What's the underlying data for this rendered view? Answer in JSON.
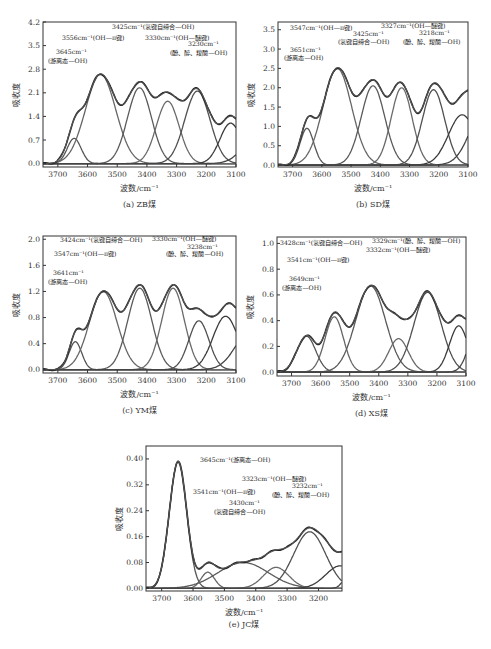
{
  "figure": {
    "panels": [
      {
        "id": "a",
        "caption": "(a) ZB煤",
        "xlabel": "波数/cm⁻¹",
        "ylabel": "吸收度",
        "box": {
          "x": 43,
          "y": 22,
          "w": 193,
          "h": 145
        },
        "xlim": [
          3750,
          3100
        ],
        "ylim": [
          -0.1,
          4.2
        ],
        "xticks": [
          3700,
          3600,
          3500,
          3400,
          3300,
          3200,
          3100
        ],
        "yticks": [
          "0.0",
          "0.7",
          "1.4",
          "2.1",
          "2.8",
          "3.5",
          "4.2"
        ],
        "yvals": [
          0,
          0.7,
          1.4,
          2.1,
          2.8,
          3.5,
          4.2
        ],
        "annotations": [
          {
            "text": "3425cm⁻¹(氢键自缔合—OH)",
            "x": 112,
            "y": 29
          },
          {
            "text": "3556cm⁻¹(OH—π键)",
            "x": 62,
            "y": 40
          },
          {
            "text": "3330cm⁻¹(OH—醚键)",
            "x": 145,
            "y": 40
          },
          {
            "text": "3230cm⁻¹",
            "x": 188,
            "y": 46
          },
          {
            "text": "3645cm⁻¹",
            "x": 56,
            "y": 54
          },
          {
            "text": "(游离态—OH)",
            "x": 48,
            "y": 63
          },
          {
            "text": "(酚、醇、羧酸—OH)",
            "x": 170,
            "y": 55
          }
        ]
      },
      {
        "id": "b",
        "caption": "(b) SD煤",
        "xlabel": "波数/cm⁻¹",
        "ylabel": "吸收度",
        "box": {
          "x": 278,
          "y": 22,
          "w": 190,
          "h": 145
        },
        "xlim": [
          3750,
          3100
        ],
        "ylim": [
          -0.05,
          3.7
        ],
        "xticks": [
          3700,
          3600,
          3500,
          3400,
          3300,
          3200,
          3100
        ],
        "yticks": [
          "0.0",
          "0.5",
          "1.0",
          "1.5",
          "2.0",
          "2.5",
          "3.0",
          "3.5"
        ],
        "yvals": [
          0,
          0.5,
          1.0,
          1.5,
          2.0,
          2.5,
          3.0,
          3.5
        ],
        "annotations": [
          {
            "text": "3547cm⁻¹(OH—π键)",
            "x": 290,
            "y": 30
          },
          {
            "text": "3327cm⁻¹(OH—醚键)",
            "x": 381,
            "y": 28
          },
          {
            "text": "3425cm⁻¹",
            "x": 353,
            "y": 36
          },
          {
            "text": "3218cm⁻¹",
            "x": 419,
            "y": 35
          },
          {
            "text": "(氢键自缔合—OH)",
            "x": 338,
            "y": 44
          },
          {
            "text": "(酚、醇、羧酸—OH)",
            "x": 403,
            "y": 44
          },
          {
            "text": "3651cm⁻¹",
            "x": 290,
            "y": 52
          },
          {
            "text": "(游离态—OH)",
            "x": 284,
            "y": 60
          }
        ]
      },
      {
        "id": "c",
        "caption": "(c) YM煤",
        "xlabel": "波数/cm⁻¹",
        "ylabel": "吸收度",
        "box": {
          "x": 43,
          "y": 236,
          "w": 193,
          "h": 137
        },
        "xlim": [
          3750,
          3100
        ],
        "ylim": [
          -0.05,
          2.05
        ],
        "xticks": [
          3700,
          3600,
          3500,
          3400,
          3300,
          3200,
          3100
        ],
        "yticks": [
          "0.0",
          "0.4",
          "0.8",
          "1.2",
          "1.6",
          "2.0"
        ],
        "yvals": [
          0,
          0.4,
          0.8,
          1.2,
          1.6,
          2.0
        ],
        "annotations": [
          {
            "text": "3424cm⁻¹(氢键自缔合—OH)",
            "x": 60,
            "y": 242
          },
          {
            "text": "3330cm⁻¹(OH—醚键)",
            "x": 152,
            "y": 241
          },
          {
            "text": "3238cm⁻¹",
            "x": 187,
            "y": 249
          },
          {
            "text": "3547cm⁻¹(OH—π键)",
            "x": 54,
            "y": 256
          },
          {
            "text": "(酚、醇、羧酸—OH)",
            "x": 166,
            "y": 256
          },
          {
            "text": "3641cm⁻¹",
            "x": 53,
            "y": 275
          },
          {
            "text": "(游离态—OH)",
            "x": 48,
            "y": 284
          }
        ]
      },
      {
        "id": "d",
        "caption": "(d) XS煤",
        "xlabel": "波数/cm⁻¹",
        "ylabel": "吸收度",
        "box": {
          "x": 277,
          "y": 237,
          "w": 189,
          "h": 139
        },
        "xlim": [
          3750,
          3100
        ],
        "ylim": [
          -0.03,
          1.05
        ],
        "xticks": [
          3700,
          3600,
          3500,
          3400,
          3300,
          3200,
          3100
        ],
        "yticks": [
          "0.0",
          "0.2",
          "0.4",
          "0.6",
          "0.8",
          "1.0"
        ],
        "yvals": [
          0,
          0.2,
          0.4,
          0.6,
          0.8,
          1.0
        ],
        "annotations": [
          {
            "text": "3428cm⁻¹(氢键自缔合—OH)",
            "x": 280,
            "y": 245
          },
          {
            "text": "3329cm⁻¹(酚、醇、羧酸—OH)",
            "x": 372,
            "y": 243
          },
          {
            "text": "3332cm⁻¹(OH—醚键)",
            "x": 366,
            "y": 252
          },
          {
            "text": "3541cm⁻¹(OH—π键)",
            "x": 287,
            "y": 262
          },
          {
            "text": "3649cm⁻¹",
            "x": 289,
            "y": 281
          },
          {
            "text": "(游离态—OH)",
            "x": 282,
            "y": 290
          }
        ]
      },
      {
        "id": "e",
        "caption": "(e) JC煤",
        "xlabel": "波数/cm⁻¹",
        "ylabel": "吸收度",
        "box": {
          "x": 146,
          "y": 446,
          "w": 196,
          "h": 145
        },
        "xlim": [
          3750,
          3125
        ],
        "ylim": [
          -0.008,
          0.44
        ],
        "xticks": [
          3700,
          3600,
          3500,
          3400,
          3300,
          3200
        ],
        "yticks": [
          "0.00",
          "0.08",
          "0.16",
          "0.24",
          "0.32",
          "0.40"
        ],
        "yvals": [
          0,
          0.08,
          0.16,
          0.24,
          0.32,
          0.4
        ],
        "annotations": [
          {
            "text": "3645cm⁻¹(游离态—OH)",
            "x": 200,
            "y": 462
          },
          {
            "text": "3323cm⁻¹(OH—醚键)",
            "x": 242,
            "y": 481
          },
          {
            "text": "3232cm⁻¹",
            "x": 292,
            "y": 488
          },
          {
            "text": "3541cm⁻¹(OH—π键)",
            "x": 193,
            "y": 494
          },
          {
            "text": "(酚、醇、羧酸—OH)",
            "x": 272,
            "y": 497
          },
          {
            "text": "3430cm⁻¹",
            "x": 229,
            "y": 505
          },
          {
            "text": "(氢键自缔合—OH)",
            "x": 214,
            "y": 514
          }
        ]
      }
    ]
  },
  "chart_data": [
    {
      "type": "line",
      "title": "(a) ZB煤",
      "xlabel": "波数/cm⁻¹",
      "ylabel": "吸收度",
      "xlim": [
        3750,
        3100
      ],
      "ylim": [
        0,
        4.2
      ],
      "xticks": [
        3700,
        3600,
        3500,
        3400,
        3300,
        3200,
        3100
      ],
      "yticks": [
        0.0,
        0.7,
        1.4,
        2.1,
        2.8,
        3.5,
        4.2
      ],
      "grid": false,
      "peaks": [
        {
          "center": 3645,
          "height": 0.75,
          "fwhm": 55,
          "label": "游离态—OH"
        },
        {
          "center": 3556,
          "height": 2.65,
          "fwhm": 120,
          "label": "OH—π键"
        },
        {
          "center": 3425,
          "height": 2.25,
          "fwhm": 95,
          "label": "氢键自缔合—OH"
        },
        {
          "center": 3330,
          "height": 1.85,
          "fwhm": 90,
          "label": "OH—醚键"
        },
        {
          "center": 3230,
          "height": 2.15,
          "fwhm": 100,
          "label": "酚、醇、羧酸—OH"
        },
        {
          "center": 3118,
          "height": 1.2,
          "fwhm": 85,
          "label": ""
        },
        {
          "center": 3020,
          "height": 0.9,
          "fwhm": 120,
          "label": ""
        }
      ],
      "annotations": [
        "3425cm⁻¹(氢键自缔合—OH)",
        "3556cm⁻¹(OH—π键)",
        "3330cm⁻¹(OH—醚键)",
        "3230cm⁻¹(酚、醇、羧酸—OH)",
        "3645cm⁻¹(游离态—OH)"
      ]
    },
    {
      "type": "line",
      "title": "(b) SD煤",
      "xlabel": "波数/cm⁻¹",
      "ylabel": "吸收度",
      "xlim": [
        3750,
        3100
      ],
      "ylim": [
        0,
        3.7
      ],
      "xticks": [
        3700,
        3600,
        3500,
        3400,
        3300,
        3200,
        3100
      ],
      "yticks": [
        0.0,
        0.5,
        1.0,
        1.5,
        2.0,
        2.5,
        3.0,
        3.5
      ],
      "grid": false,
      "peaks": [
        {
          "center": 3651,
          "height": 0.95,
          "fwhm": 55,
          "label": "游离态—OH"
        },
        {
          "center": 3547,
          "height": 2.5,
          "fwhm": 115,
          "label": "OH—π键"
        },
        {
          "center": 3425,
          "height": 2.05,
          "fwhm": 95,
          "label": "氢键自缔合—OH"
        },
        {
          "center": 3327,
          "height": 2.0,
          "fwhm": 85,
          "label": "OH—醚键"
        },
        {
          "center": 3218,
          "height": 1.95,
          "fwhm": 90,
          "label": "酚、醇、羧酸—OH"
        },
        {
          "center": 3120,
          "height": 1.3,
          "fwhm": 110,
          "label": ""
        },
        {
          "center": 3040,
          "height": 1.5,
          "fwhm": 120,
          "label": ""
        }
      ],
      "annotations": [
        "3547cm⁻¹(OH—π键)",
        "3425cm⁻¹(氢键自缔合—OH)",
        "3327cm⁻¹(OH—醚键)",
        "3218cm⁻¹(酚、醇、羧酸—OH)",
        "3651cm⁻¹(游离态—OH)"
      ]
    },
    {
      "type": "line",
      "title": "(c) YM煤",
      "xlabel": "波数/cm⁻¹",
      "ylabel": "吸收度",
      "xlim": [
        3750,
        3100
      ],
      "ylim": [
        0,
        2.0
      ],
      "xticks": [
        3700,
        3600,
        3500,
        3400,
        3300,
        3200,
        3100
      ],
      "yticks": [
        0.0,
        0.4,
        0.8,
        1.2,
        1.6,
        2.0
      ],
      "grid": false,
      "peaks": [
        {
          "center": 3641,
          "height": 0.43,
          "fwhm": 50,
          "label": "游离态—OH"
        },
        {
          "center": 3547,
          "height": 1.2,
          "fwhm": 110,
          "label": "OH—π键"
        },
        {
          "center": 3424,
          "height": 1.25,
          "fwhm": 95,
          "label": "氢键自缔合—OH"
        },
        {
          "center": 3312,
          "height": 1.25,
          "fwhm": 90,
          "label": "OH—醚键"
        },
        {
          "center": 3225,
          "height": 0.75,
          "fwhm": 80,
          "label": "酚、醇、羧酸—OH"
        },
        {
          "center": 3135,
          "height": 0.82,
          "fwhm": 100,
          "label": ""
        },
        {
          "center": 3050,
          "height": 0.6,
          "fwhm": 120,
          "label": ""
        }
      ],
      "annotations": [
        "3424cm⁻¹(氢键自缔合—OH)",
        "3330cm⁻¹(OH—醚键)",
        "3238cm⁻¹(酚、醇、羧酸—OH)",
        "3547cm⁻¹(OH—π键)",
        "3641cm⁻¹(游离态—OH)"
      ]
    },
    {
      "type": "line",
      "title": "(d) XS煤",
      "xlabel": "波数/cm⁻¹",
      "ylabel": "吸收度",
      "xlim": [
        3750,
        3100
      ],
      "ylim": [
        0,
        1.0
      ],
      "xticks": [
        3700,
        3600,
        3500,
        3400,
        3300,
        3200,
        3100
      ],
      "yticks": [
        0.0,
        0.2,
        0.4,
        0.6,
        0.8,
        1.0
      ],
      "grid": false,
      "peaks": [
        {
          "center": 3649,
          "height": 0.28,
          "fwhm": 75,
          "label": "游离态—OH"
        },
        {
          "center": 3553,
          "height": 0.43,
          "fwhm": 75,
          "label": "OH—π键"
        },
        {
          "center": 3428,
          "height": 0.67,
          "fwhm": 120,
          "label": "氢键自缔合—OH"
        },
        {
          "center": 3332,
          "height": 0.26,
          "fwhm": 80,
          "label": "OH—醚键"
        },
        {
          "center": 3232,
          "height": 0.62,
          "fwhm": 110,
          "label": "酚、醇、羧酸—OH"
        },
        {
          "center": 3125,
          "height": 0.36,
          "fwhm": 75,
          "label": ""
        },
        {
          "center": 3060,
          "height": 0.35,
          "fwhm": 70,
          "label": ""
        }
      ],
      "annotations": [
        "3428cm⁻¹(氢键自缔合—OH)",
        "3329cm⁻¹(酚、醇、羧酸—OH)",
        "3332cm⁻¹(OH—醚键)",
        "3541cm⁻¹(OH—π键)",
        "3649cm⁻¹(游离态—OH)"
      ]
    },
    {
      "type": "line",
      "title": "(e) JC煤",
      "xlabel": "波数/cm⁻¹",
      "ylabel": "吸收度",
      "xlim": [
        3750,
        3125
      ],
      "ylim": [
        0,
        0.44
      ],
      "xticks": [
        3700,
        3600,
        3500,
        3400,
        3300,
        3200
      ],
      "yticks": [
        0.0,
        0.08,
        0.16,
        0.24,
        0.32,
        0.4
      ],
      "grid": false,
      "peaks": [
        {
          "center": 3648,
          "height": 0.39,
          "fwhm": 65,
          "label": "游离态—OH"
        },
        {
          "center": 3553,
          "height": 0.05,
          "fwhm": 50,
          "label": "OH—π键"
        },
        {
          "center": 3440,
          "height": 0.08,
          "fwhm": 190,
          "label": "氢键自缔合—OH"
        },
        {
          "center": 3335,
          "height": 0.065,
          "fwhm": 95,
          "label": "OH—醚键"
        },
        {
          "center": 3228,
          "height": 0.175,
          "fwhm": 120,
          "label": "酚、醇、羧酸—OH"
        },
        {
          "center": 3130,
          "height": 0.07,
          "fwhm": 110,
          "label": ""
        },
        {
          "center": 3090,
          "height": 0.08,
          "fwhm": 50,
          "label": ""
        }
      ],
      "annotations": [
        "3645cm⁻¹(游离态—OH)",
        "3323cm⁻¹(OH—醚键)",
        "3232cm⁻¹(酚、醇、羧酸—OH)",
        "3541cm⁻¹(OH—π键)",
        "3430cm⁻¹(氢键自缔合—OH)"
      ]
    }
  ]
}
